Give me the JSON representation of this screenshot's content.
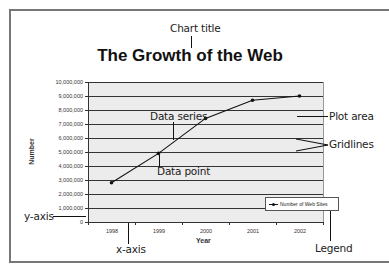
{
  "callouts": {
    "chart_title": "Chart title",
    "data_series": "Data series",
    "data_point": "Data point",
    "plot_area": "Plot area",
    "gridlines": "Gridlines",
    "y_axis": "y-axis",
    "x_axis": "x-axis",
    "legend": "Legend"
  },
  "colors": {
    "plot_background": "#ececec",
    "series_line": "#111111",
    "gridline": "#333333"
  },
  "chart_data": {
    "type": "line",
    "title": "The Growth of the Web",
    "xlabel": "Year",
    "ylabel": "Number",
    "categories": [
      "1998",
      "1999",
      "2000",
      "2001",
      "2002"
    ],
    "series": [
      {
        "name": "Number of Web Sites",
        "values": [
          2800000,
          4900000,
          7400000,
          8700000,
          9000000
        ]
      }
    ],
    "yticks": [
      "0",
      "1,000,000",
      "2,000,000",
      "3,000,000",
      "4,000,000",
      "5,000,000",
      "6,000,000",
      "7,000,000",
      "8,000,000",
      "9,000,000",
      "10,000,000"
    ],
    "ylim": [
      0,
      10000000
    ],
    "grid": true,
    "legend_position": "lower right"
  }
}
